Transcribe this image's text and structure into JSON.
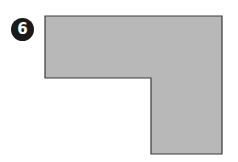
{
  "figure": {
    "label": "6",
    "shape": {
      "type": "L-shape",
      "fill": "#b8b8b8",
      "stroke": "#3a3a3a",
      "points": "45,16 222,16 222,154 151,154 151,78 45,78"
    }
  }
}
